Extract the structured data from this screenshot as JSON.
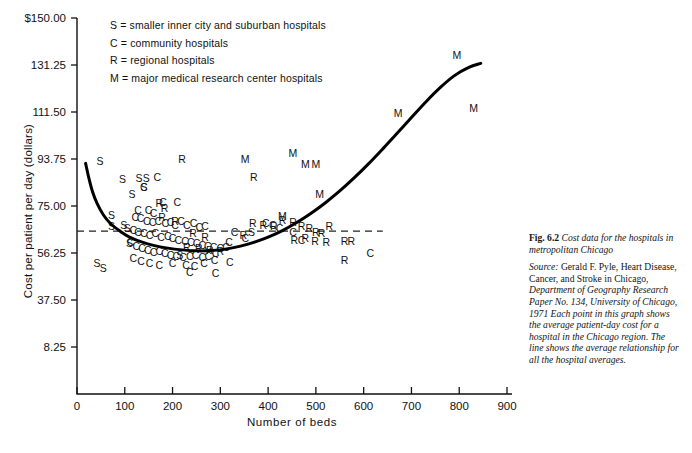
{
  "chart_data": {
    "type": "scatter",
    "title": "Cost data for the hospitals in metropolitan Chicago",
    "xlabel": "Number of beds",
    "ylabel": "Cost per patient per day (dollars)",
    "xlim": [
      0,
      900
    ],
    "ylim": [
      8.25,
      150.0
    ],
    "xticks": [
      0,
      100,
      200,
      300,
      400,
      500,
      600,
      700,
      800,
      900
    ],
    "xtick_labels": [
      "0",
      "100",
      "200",
      "300",
      "400",
      "500",
      "600",
      "700",
      "800",
      "900"
    ],
    "yticks": [
      150.0,
      131.25,
      111.5,
      93.75,
      75.0,
      56.25,
      37.5,
      8.25
    ],
    "ytick_labels": [
      "$150.00",
      "131.25",
      "111.50",
      "93.75",
      "75.00",
      "56.25",
      "37.50",
      "8.25"
    ],
    "grid": false,
    "legend_position": "top-center-inside",
    "legend": [
      {
        "marker": "S",
        "label": "S = smaller inner city and suburban hospitals"
      },
      {
        "marker": "C",
        "label": "C = community hospitals"
      },
      {
        "marker": "R",
        "label": "R = regional hospitals"
      },
      {
        "marker": "M",
        "label": "M = major medical research center hospitals"
      }
    ],
    "reference_line": {
      "name": "mean-cost-dashed-line",
      "orientation": "horizontal",
      "y": 65.0,
      "style": "dashed",
      "x_start": 0,
      "x_end": 640
    },
    "fitted_curve": {
      "name": "average-relationship-curve",
      "style": "solid",
      "points": [
        [
          18,
          92.0
        ],
        [
          25,
          86.0
        ],
        [
          32,
          81.0
        ],
        [
          42,
          76.0
        ],
        [
          55,
          71.5
        ],
        [
          70,
          68.0
        ],
        [
          90,
          65.0
        ],
        [
          110,
          62.6
        ],
        [
          135,
          60.7
        ],
        [
          160,
          59.3
        ],
        [
          190,
          58.2
        ],
        [
          220,
          57.5
        ],
        [
          250,
          57.1
        ],
        [
          280,
          57.2
        ],
        [
          310,
          57.8
        ],
        [
          340,
          58.9
        ],
        [
          370,
          60.5
        ],
        [
          400,
          62.6
        ],
        [
          430,
          65.2
        ],
        [
          460,
          68.4
        ],
        [
          490,
          72.1
        ],
        [
          520,
          76.3
        ],
        [
          550,
          81.0
        ],
        [
          580,
          86.2
        ],
        [
          610,
          91.8
        ],
        [
          640,
          97.8
        ],
        [
          670,
          104.0
        ],
        [
          700,
          110.3
        ],
        [
          730,
          116.5
        ],
        [
          760,
          122.2
        ],
        [
          790,
          127.0
        ],
        [
          820,
          130.3
        ],
        [
          845,
          131.9
        ]
      ]
    },
    "series": [
      {
        "name": "S",
        "label": "smaller inner city and suburban hospitals",
        "points": [
          [
            48,
            91.5
          ],
          [
            95,
            84.0
          ],
          [
            130,
            84.5
          ],
          [
            145,
            84.5
          ],
          [
            140,
            80.8
          ],
          [
            72,
            70.0
          ],
          [
            72,
            65.5
          ],
          [
            98,
            66.0
          ],
          [
            105,
            64.5
          ],
          [
            115,
            78.0
          ],
          [
            110,
            58.5
          ],
          [
            42,
            50.5
          ],
          [
            55,
            48.5
          ],
          [
            215,
            54.0
          ],
          [
            365,
            63.0
          ]
        ]
      },
      {
        "name": "C",
        "label": "community hospitals",
        "points": [
          [
            168,
            85.0
          ],
          [
            140,
            81.0
          ],
          [
            180,
            75.0
          ],
          [
            210,
            75.0
          ],
          [
            128,
            72.0
          ],
          [
            150,
            72.0
          ],
          [
            160,
            70.5
          ],
          [
            122,
            69.0
          ],
          [
            133,
            68.5
          ],
          [
            146,
            67.5
          ],
          [
            158,
            67.0
          ],
          [
            170,
            67.5
          ],
          [
            185,
            66.5
          ],
          [
            196,
            67.0
          ],
          [
            205,
            66.0
          ],
          [
            218,
            67.5
          ],
          [
            230,
            66.0
          ],
          [
            244,
            66.5
          ],
          [
            256,
            65.0
          ],
          [
            268,
            65.5
          ],
          [
            118,
            64.0
          ],
          [
            128,
            63.0
          ],
          [
            140,
            62.5
          ],
          [
            152,
            62.0
          ],
          [
            164,
            62.5
          ],
          [
            176,
            61.0
          ],
          [
            190,
            61.5
          ],
          [
            200,
            60.5
          ],
          [
            212,
            60.0
          ],
          [
            226,
            59.5
          ],
          [
            238,
            59.0
          ],
          [
            250,
            58.5
          ],
          [
            262,
            58.0
          ],
          [
            274,
            57.5
          ],
          [
            286,
            57.0
          ],
          [
            112,
            59.0
          ],
          [
            124,
            57.5
          ],
          [
            136,
            56.5
          ],
          [
            148,
            56.0
          ],
          [
            160,
            55.0
          ],
          [
            172,
            55.5
          ],
          [
            184,
            54.5
          ],
          [
            196,
            54.0
          ],
          [
            208,
            53.5
          ],
          [
            222,
            53.0
          ],
          [
            236,
            53.5
          ],
          [
            248,
            54.0
          ],
          [
            262,
            53.0
          ],
          [
            275,
            53.5
          ],
          [
            290,
            54.5
          ],
          [
            300,
            56.5
          ],
          [
            312,
            57.0
          ],
          [
            118,
            52.5
          ],
          [
            134,
            51.5
          ],
          [
            152,
            50.5
          ],
          [
            172,
            50.0
          ],
          [
            200,
            50.5
          ],
          [
            228,
            50.0
          ],
          [
            246,
            49.5
          ],
          [
            266,
            50.5
          ],
          [
            288,
            52.0
          ],
          [
            318,
            59.0
          ],
          [
            330,
            63.0
          ],
          [
            352,
            60.5
          ],
          [
            395,
            66.5
          ],
          [
            410,
            66.0
          ],
          [
            424,
            64.5
          ],
          [
            452,
            63.0
          ],
          [
            470,
            60.0
          ],
          [
            614,
            54.5
          ],
          [
            290,
            46.5
          ],
          [
            236,
            47.0
          ],
          [
            320,
            51.0
          ]
        ]
      },
      {
        "name": "R",
        "label": "regional hospitals",
        "points": [
          [
            220,
            92.0
          ],
          [
            172,
            74.5
          ],
          [
            183,
            72.5
          ],
          [
            178,
            69.0
          ],
          [
            205,
            67.5
          ],
          [
            243,
            62.5
          ],
          [
            268,
            61.0
          ],
          [
            230,
            57.0
          ],
          [
            255,
            56.5
          ],
          [
            278,
            56.0
          ],
          [
            300,
            55.5
          ],
          [
            348,
            62.0
          ],
          [
            368,
            66.5
          ],
          [
            390,
            66.0
          ],
          [
            412,
            65.5
          ],
          [
            430,
            68.0
          ],
          [
            452,
            67.0
          ],
          [
            470,
            65.5
          ],
          [
            486,
            64.5
          ],
          [
            500,
            63.0
          ],
          [
            512,
            62.5
          ],
          [
            528,
            65.5
          ],
          [
            455,
            60.0
          ],
          [
            478,
            60.5
          ],
          [
            498,
            59.5
          ],
          [
            522,
            59.0
          ],
          [
            560,
            52.0
          ],
          [
            560,
            59.5
          ],
          [
            574,
            59.5
          ],
          [
            370,
            85.0
          ]
        ]
      },
      {
        "name": "M",
        "label": "major medical research center hospitals",
        "points": [
          [
            352,
            92.0
          ],
          [
            452,
            94.5
          ],
          [
            478,
            90.0
          ],
          [
            500,
            90.0
          ],
          [
            508,
            78.0
          ],
          [
            430,
            69.5
          ],
          [
            795,
            133.5
          ],
          [
            830,
            112.5
          ],
          [
            672,
            110.5
          ]
        ]
      }
    ]
  },
  "caption": {
    "fig_number": "Fig. 6.2",
    "title": "Cost data for the hospitals in metropolitan Chicago",
    "source_label": "Source:",
    "source_body_1": "Gerald F. Pyle,",
    "source_body_2": "Heart Disease, Cancer, and Stroke in Chicago,",
    "source_body_3": "Department of Geography Research Paper No. 134, University of Chicago, 1971",
    "source_body_4": "Each point in this graph shows the average patient-day cost for a hospital in the Chicago region. The line shows the average relationship for all the hospital averages."
  },
  "colors": {
    "ink": "#111111",
    "background": "#ffffff",
    "curve": "#000000",
    "dashed": "#222222"
  }
}
